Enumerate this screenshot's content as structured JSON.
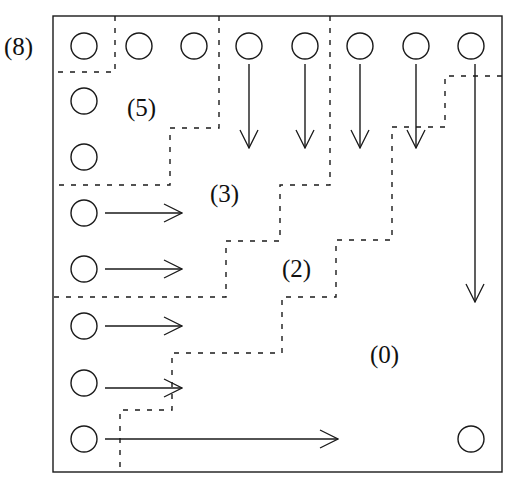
{
  "diagram": {
    "type": "grid-partition",
    "stroke_color": "#1a1a1a",
    "background": "#ffffff",
    "frame": {
      "x": 53,
      "y": 16,
      "width": 449,
      "height": 456
    },
    "grid": {
      "cols_x": [
        84,
        139,
        194,
        249,
        305,
        360,
        416,
        471
      ],
      "rows_y": [
        46,
        101,
        157,
        213,
        269,
        326,
        383,
        439
      ],
      "circle_radius": 13
    },
    "circles": [
      {
        "col": 0,
        "row": 0
      },
      {
        "col": 1,
        "row": 0
      },
      {
        "col": 2,
        "row": 0
      },
      {
        "col": 3,
        "row": 0
      },
      {
        "col": 4,
        "row": 0
      },
      {
        "col": 5,
        "row": 0
      },
      {
        "col": 6,
        "row": 0
      },
      {
        "col": 7,
        "row": 0
      },
      {
        "col": 0,
        "row": 1
      },
      {
        "col": 0,
        "row": 2
      },
      {
        "col": 0,
        "row": 3
      },
      {
        "col": 0,
        "row": 4
      },
      {
        "col": 0,
        "row": 5
      },
      {
        "col": 0,
        "row": 6
      },
      {
        "col": 0,
        "row": 7
      },
      {
        "col": 7,
        "row": 7
      }
    ],
    "arrows": [
      {
        "dir": "down",
        "x1": 249,
        "y1": 64,
        "x2": 249,
        "y2": 148
      },
      {
        "dir": "down",
        "x1": 305,
        "y1": 64,
        "x2": 305,
        "y2": 148
      },
      {
        "dir": "down",
        "x1": 360,
        "y1": 64,
        "x2": 360,
        "y2": 148
      },
      {
        "dir": "down",
        "x1": 416,
        "y1": 64,
        "x2": 416,
        "y2": 148
      },
      {
        "dir": "down",
        "x1": 475,
        "y1": 64,
        "x2": 475,
        "y2": 302
      },
      {
        "dir": "right",
        "x1": 105,
        "y1": 213,
        "x2": 182,
        "y2": 213
      },
      {
        "dir": "right",
        "x1": 105,
        "y1": 269,
        "x2": 182,
        "y2": 269
      },
      {
        "dir": "right",
        "x1": 105,
        "y1": 326,
        "x2": 182,
        "y2": 326
      },
      {
        "dir": "right",
        "x1": 105,
        "y1": 388,
        "x2": 182,
        "y2": 388
      },
      {
        "dir": "right",
        "x1": 105,
        "y1": 439,
        "x2": 338,
        "y2": 439
      }
    ],
    "boundaries": [
      {
        "name": "region-8-boundary",
        "points": "115,16 115,72 53,72"
      },
      {
        "name": "region-5-boundary",
        "points": "219,16 219,128 170,128 170,185 53,185"
      },
      {
        "name": "region-3-boundary",
        "points": "330,16 330,185 280,185 280,241 226,241 226,297 53,297"
      },
      {
        "name": "region-2-boundary",
        "points": "502,76 445,76 445,127 392,127 392,240 336,240 336,297 282,297 282,353 172,353 172,410 120,410 120,472"
      }
    ],
    "labels": [
      {
        "id": "label-8",
        "text": "(8)",
        "x": 4,
        "y": 55
      },
      {
        "id": "label-5",
        "text": "(5)",
        "x": 127,
        "y": 116
      },
      {
        "id": "label-3",
        "text": "(3)",
        "x": 210,
        "y": 202
      },
      {
        "id": "label-2",
        "text": "(2)",
        "x": 282,
        "y": 277
      },
      {
        "id": "label-0",
        "text": "(0)",
        "x": 370,
        "y": 363
      }
    ]
  }
}
